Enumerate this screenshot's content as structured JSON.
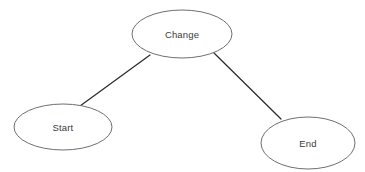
{
  "diagram": {
    "background_color": "#ffffff",
    "node_fill": "#ffffff",
    "node_stroke": "#6f6f6f",
    "edge_color": "#2b2b2b",
    "label_color": "#3a3a3a",
    "nodes": [
      {
        "id": "change",
        "label": "Change",
        "shape": "ellipse",
        "cx": 182,
        "cy": 34,
        "rx": 50,
        "ry": 24
      },
      {
        "id": "start",
        "label": "Start",
        "shape": "ellipse",
        "cx": 63,
        "cy": 127,
        "rx": 49,
        "ry": 23
      },
      {
        "id": "end",
        "label": "End",
        "shape": "ellipse",
        "cx": 308,
        "cy": 143,
        "rx": 47,
        "ry": 26
      }
    ],
    "edges": [
      {
        "id": "change-start",
        "from": "change",
        "to": "start",
        "x1": 150,
        "y1": 55,
        "x2": 80,
        "y2": 106,
        "arrow": "none"
      },
      {
        "id": "change-end",
        "from": "change",
        "to": "end",
        "x1": 214,
        "y1": 53,
        "x2": 281,
        "y2": 119,
        "arrow": "none"
      }
    ]
  }
}
